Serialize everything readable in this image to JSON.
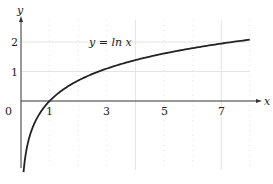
{
  "chart_data": {
    "type": "line",
    "title": "",
    "annotation": "y = ln x",
    "xlabel": "x",
    "ylabel": "y",
    "origin_label": "0",
    "x_ticks": [
      "1",
      "3",
      "5",
      "7"
    ],
    "y_ticks": [
      "1",
      "2"
    ],
    "xlim": [
      0,
      8.3
    ],
    "ylim": [
      -2.5,
      2.6
    ],
    "grid": true,
    "series": [
      {
        "name": "y = ln x",
        "x": [
          0.09,
          0.2,
          0.5,
          1,
          2,
          3,
          4,
          5,
          6,
          7,
          8
        ],
        "values": [
          -2.41,
          -1.61,
          -0.69,
          0,
          0.69,
          1.1,
          1.39,
          1.61,
          1.79,
          1.95,
          2.08
        ]
      }
    ],
    "colors": {
      "curve": "#222222",
      "axis": "#333333",
      "grid": "#dddddd"
    }
  }
}
